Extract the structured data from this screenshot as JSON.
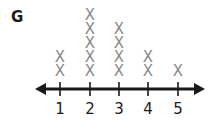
{
  "figure": {
    "label": "G"
  },
  "chart_data": {
    "type": "scatter",
    "subtype": "line_plot_x_marks",
    "title": "",
    "panel_label": "G",
    "xlabel": "",
    "ylabel": "",
    "categories": [
      "1",
      "2",
      "3",
      "4",
      "5"
    ],
    "values": [
      2,
      5,
      4,
      2,
      1
    ],
    "marker": "X",
    "xlim": [
      1,
      5
    ],
    "axis": "number line with arrows on both ends",
    "grid": false,
    "legend": null,
    "colors": {
      "marker": "#8a8a8a",
      "axis": "#1a1a1a"
    }
  }
}
